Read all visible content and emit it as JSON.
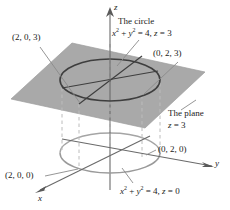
{
  "figure": {
    "type": "3d-coordinate-diagram",
    "colors": {
      "plane_fill": "#a9a9a9",
      "plane_edge": "#8f8f8f",
      "upper_circle": "#3a3a3a",
      "lower_circle": "#9a9a9a",
      "axis": "#5a5a5a",
      "dashed": "#b5b5b5",
      "leader": "#8a8a8a",
      "text": "#1a1a1a",
      "background": "#ffffff"
    }
  },
  "axes": {
    "z": {
      "name": "z",
      "x": 110,
      "y": 5
    },
    "y": {
      "name": "y",
      "x": 213,
      "y": 160
    },
    "x": {
      "name": "x",
      "x": 40,
      "y": 196
    }
  },
  "labels": {
    "circle_title": "The circle",
    "circle_equation_prefix": "x",
    "circle_equation": "x² + y² = 4, z = 3",
    "plane_title": "The plane",
    "plane_equation": "z = 3",
    "base_equation": "x² + y² = 4, z = 0"
  },
  "points": [
    {
      "id": "p203",
      "label": "(2, 0, 3)",
      "x": 12,
      "y": 36
    },
    {
      "id": "p023",
      "label": "(0, 2, 3)",
      "x": 153,
      "y": 52
    },
    {
      "id": "p020",
      "label": "(0, 2, 0)",
      "x": 158,
      "y": 148
    },
    {
      "id": "p200",
      "label": "(2, 0, 0)",
      "x": 5,
      "y": 174
    }
  ],
  "geometry": {
    "plane_vertices": "72,43 205,72 145,128 11,99",
    "upper_ellipse": {
      "cx": 110,
      "cy": 80,
      "rx": 50,
      "ry": 21
    },
    "lower_ellipse": {
      "cx": 110,
      "cy": 153,
      "rx": 50,
      "ry": 20
    },
    "plane_z_label": "3",
    "circle_radius_value": "2"
  }
}
